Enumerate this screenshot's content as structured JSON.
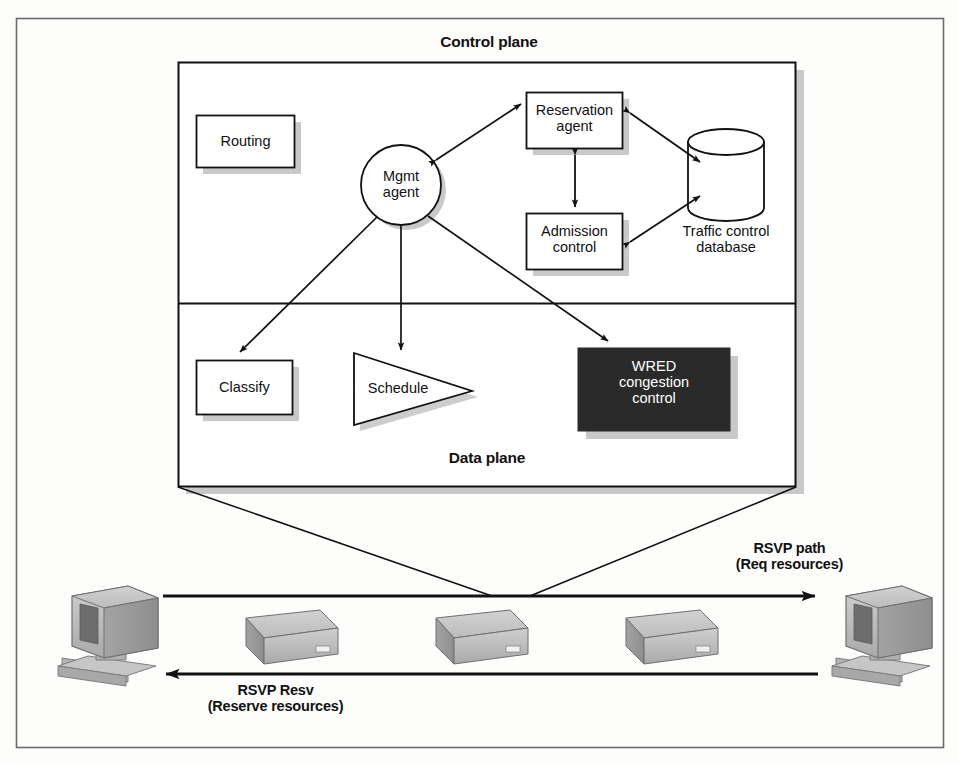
{
  "figure": {
    "kind": "network-architecture-diagram",
    "frame_border_color": "#6b6b6b",
    "background_color": "#fdfdfc",
    "stroke_color": "#111111",
    "shadow_color": "#9a9a9a",
    "dark_fill": "#2a2a2a",
    "device_fill": "#b9b9b9"
  },
  "planes": {
    "control": {
      "title": "Control plane"
    },
    "data": {
      "title": "Data plane"
    }
  },
  "control_nodes": [
    {
      "id": "routing",
      "label": "Routing",
      "shape": "rectangle"
    },
    {
      "id": "mgmt-agent",
      "label": "Mgmt\nagent",
      "shape": "circle"
    },
    {
      "id": "reservation-agent",
      "label": "Reservation\nagent",
      "shape": "rectangle"
    },
    {
      "id": "admission-control",
      "label": "Admission\ncontrol",
      "shape": "rectangle"
    },
    {
      "id": "traffic-control-database",
      "label": "Traffic control\ndatabase",
      "shape": "cylinder"
    }
  ],
  "data_nodes": [
    {
      "id": "classify",
      "label": "Classify",
      "shape": "rectangle"
    },
    {
      "id": "schedule",
      "label": "Schedule",
      "shape": "triangle"
    },
    {
      "id": "wred-congestion-control",
      "label": "WRED\ncongestion\ncontrol",
      "shape": "rectangle-dark"
    }
  ],
  "flows": [
    {
      "id": "rsvp-path",
      "label": "RSVP path\n(Req resources)",
      "direction": "right"
    },
    {
      "id": "rsvp-resv",
      "label": "RSVP Resv\n(Reserve resources)",
      "direction": "left"
    }
  ],
  "network": {
    "hosts": [
      {
        "id": "host-left",
        "type": "workstation"
      },
      {
        "id": "host-right",
        "type": "workstation"
      }
    ],
    "routers": [
      {
        "id": "router-1",
        "type": "router"
      },
      {
        "id": "router-2",
        "type": "router"
      },
      {
        "id": "router-3",
        "type": "router"
      }
    ]
  }
}
